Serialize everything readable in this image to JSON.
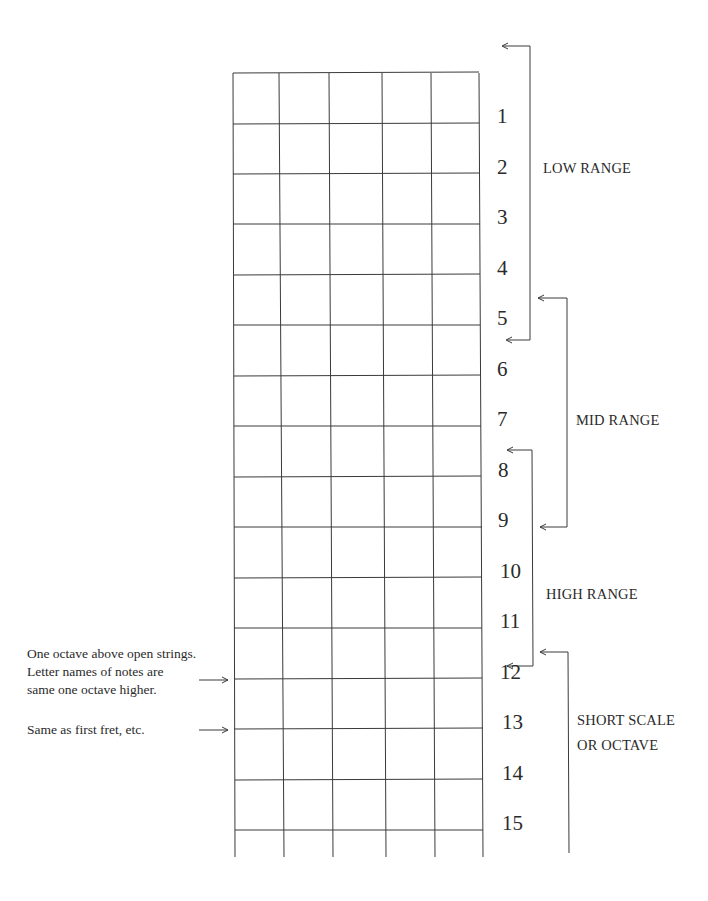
{
  "fretboard": {
    "strings": 6,
    "frets": 15,
    "fret_numbers": [
      "1",
      "2",
      "3",
      "4",
      "5",
      "6",
      "7",
      "8",
      "9",
      "10",
      "11",
      "12",
      "13",
      "14",
      "15"
    ],
    "line_color": "#3a3a3a"
  },
  "ranges": [
    {
      "label": "LOW RANGE",
      "from_fret": "open",
      "to_fret": "5"
    },
    {
      "label": "MID RANGE",
      "from_fret": "5",
      "to_fret": "9"
    },
    {
      "label": "HIGH RANGE",
      "from_fret": "8",
      "to_fret": "12"
    },
    {
      "label_line1": "SHORT SCALE",
      "label_line2": "OR OCTAVE",
      "from_fret": "12",
      "to_fret": "15"
    }
  ],
  "annotations": {
    "octave_note": {
      "line1": "One octave above open strings.",
      "line2": "Letter names of notes are",
      "line3": "same one octave higher."
    },
    "first_fret_note": "Same as first fret, etc."
  }
}
